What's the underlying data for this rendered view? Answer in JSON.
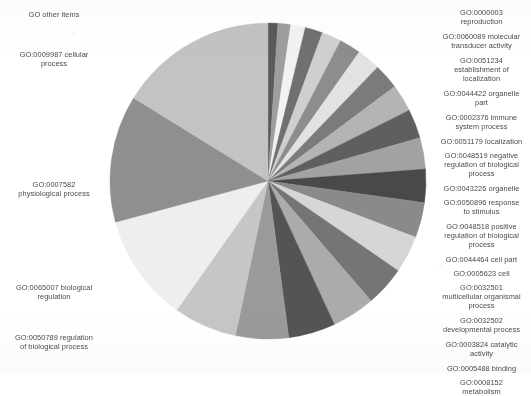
{
  "chart_data": {
    "type": "pie",
    "title": "",
    "subtitle": "",
    "xlabel": "",
    "ylabel": "",
    "legend_position": "outside-labels-both-sides",
    "grid": false,
    "units": "percent of annotated GO terms",
    "note": "Grayscale pie of Gene Ontology term distribution; slices ordered clockwise starting at 12 o'clock.",
    "start_angle_deg": 0,
    "direction": "clockwise",
    "center": {
      "x": 268,
      "y": 181
    },
    "radius": 159,
    "slices": [
      {
        "label": "GO:0000003 reproduction",
        "short": "reproduction",
        "value": 1.0,
        "color": "#5a5a5a",
        "side": "right"
      },
      {
        "label": "GO:0060089 molecular transducer activity",
        "short": "molecular transducer activity",
        "value": 1.3,
        "color": "#9e9e9e",
        "side": "right"
      },
      {
        "label": "GO:0051234 establishment of localization",
        "short": "establishment of localization",
        "value": 1.5,
        "color": "#f2f2f2",
        "side": "right"
      },
      {
        "label": "GO:0044422 organelle part",
        "short": "organelle part",
        "value": 1.8,
        "color": "#707070",
        "side": "right"
      },
      {
        "label": "GO:0002376 immune system process",
        "short": "immune system process",
        "value": 2.0,
        "color": "#cfcfcf",
        "side": "right"
      },
      {
        "label": "GO:0051179 localization",
        "short": "localization",
        "value": 2.2,
        "color": "#8d8d8d",
        "side": "right"
      },
      {
        "label": "GO:0048519 negative regulation of biological process",
        "short": "negative regulation of biological process",
        "value": 2.4,
        "color": "#e2e2e2",
        "side": "right"
      },
      {
        "label": "GO:0043226 organelle",
        "short": "organelle",
        "value": 2.6,
        "color": "#7b7b7b",
        "side": "right"
      },
      {
        "label": "GO:0050896 response to stimulus",
        "short": "response to stimulus",
        "value": 2.8,
        "color": "#b4b4b4",
        "side": "right"
      },
      {
        "label": "GO:0048518 positive regulation of biological process",
        "short": "positive regulation of biological process",
        "value": 3.0,
        "color": "#5f5f5f",
        "side": "right"
      },
      {
        "label": "GO:0044464 cell part",
        "short": "cell part",
        "value": 3.2,
        "color": "#a2a2a2",
        "side": "right"
      },
      {
        "label": "GO:0005623 cell",
        "short": "cell",
        "value": 3.4,
        "color": "#494949",
        "side": "right"
      },
      {
        "label": "GO:0032501 multicellular organismal process",
        "short": "multicellular organismal process",
        "value": 3.6,
        "color": "#8a8a8a",
        "side": "right"
      },
      {
        "label": "GO:0032502 developmental process",
        "short": "developmental process",
        "value": 3.8,
        "color": "#d6d6d6",
        "side": "right"
      },
      {
        "label": "GO:0003824 catalytic activity",
        "short": "catalytic activity",
        "value": 4.1,
        "color": "#757575",
        "side": "right"
      },
      {
        "label": "GO:0005488 binding",
        "short": "binding",
        "value": 4.4,
        "color": "#ababab",
        "side": "right"
      },
      {
        "label": "GO:0008152 metabolism",
        "short": "metabolism",
        "value": 4.8,
        "color": "#545454",
        "side": "right"
      },
      {
        "label": "GO:0050789 regulation of biological process",
        "short": "regulation of biological process",
        "value": 5.4,
        "color": "#9a9a9a",
        "side": "left"
      },
      {
        "label": "GO:0065007 biological regulation",
        "short": "biological regulation",
        "value": 6.5,
        "color": "#c6c6c6",
        "side": "left"
      },
      {
        "label": "GO:0007582 physiological process",
        "short": "physiological process",
        "value": 11.0,
        "color": "#eeeeee",
        "side": "left"
      },
      {
        "label": "GO:0009987 cellular process",
        "short": "cellular process",
        "value": 13.0,
        "color": "#8f8f8f",
        "side": "left"
      },
      {
        "label": "GO other items",
        "short": "other items",
        "value": 16.2,
        "color": "#c3c3c3",
        "side": "left"
      }
    ]
  },
  "left_labels": [
    {
      "text": "GO other items",
      "top": 10,
      "name": "label-go-other-items"
    },
    {
      "text": "GO:0009987 cellular\nprocess",
      "top": 50,
      "name": "label-go-0009987-cellular-process"
    },
    {
      "text": "GO:0007582\nphysiological process",
      "top": 180,
      "name": "label-go-0007582-physiological-process"
    },
    {
      "text": "GO:0065007 biological\nregulation",
      "top": 283,
      "name": "label-go-0065007-biological-regulation"
    },
    {
      "text": "GO:0050789 regulation\nof biological process",
      "top": 333,
      "name": "label-go-0050789-regulation-of-biological-process"
    }
  ],
  "right_labels": [
    {
      "text": "GO:0000003\nreproduction",
      "top": 8,
      "name": "label-go-0000003-reproduction"
    },
    {
      "text": "GO:0060089 molecular\ntransducer activity",
      "top": 32,
      "name": "label-go-0060089-molecular-transducer-activity"
    },
    {
      "text": "GO:0051234\nestablishment of\nlocalization",
      "top": 56,
      "name": "label-go-0051234-establishment-of-localization"
    },
    {
      "text": "GO:0044422 organelle\npart",
      "top": 89,
      "name": "label-go-0044422-organelle-part"
    },
    {
      "text": "GO:0002376 immune\nsystem process",
      "top": 113,
      "name": "label-go-0002376-immune-system-process"
    },
    {
      "text": "GO:0051179 localization",
      "top": 137,
      "name": "label-go-0051179-localization"
    },
    {
      "text": "GO:0048519 negative\nregulation of biological\nprocess",
      "top": 151,
      "name": "label-go-0048519-negative-regulation-of-biological-process"
    },
    {
      "text": "GO:0043226 organelle",
      "top": 184,
      "name": "label-go-0043226-organelle"
    },
    {
      "text": "GO:0050896 response\nto stimulus",
      "top": 198,
      "name": "label-go-0050896-response-to-stimulus"
    },
    {
      "text": "GO:0048518 positive\nregulation of biological\nprocess",
      "top": 222,
      "name": "label-go-0048518-positive-regulation-of-biological-process"
    },
    {
      "text": "GO:0044464 cell part",
      "top": 255,
      "name": "label-go-0044464-cell-part"
    },
    {
      "text": "GO:0005623 cell",
      "top": 269,
      "name": "label-go-0005623-cell"
    },
    {
      "text": "GO:0032501\nmulticellular organismal\nprocess",
      "top": 283,
      "name": "label-go-0032501-multicellular-organismal-process"
    },
    {
      "text": "GO:0032502\ndevelopmental process",
      "top": 316,
      "name": "label-go-0032502-developmental-process"
    },
    {
      "text": "GO:0003824 catalytic\nactivity",
      "top": 340,
      "name": "label-go-0003824-catalytic-activity"
    },
    {
      "text": "GO:0005488 binding",
      "top": 364,
      "name": "label-go-0005488-binding"
    },
    {
      "text": "GO:0008152\nmetabolism",
      "top": 378,
      "name": "label-go-0008152-metabolism"
    }
  ]
}
